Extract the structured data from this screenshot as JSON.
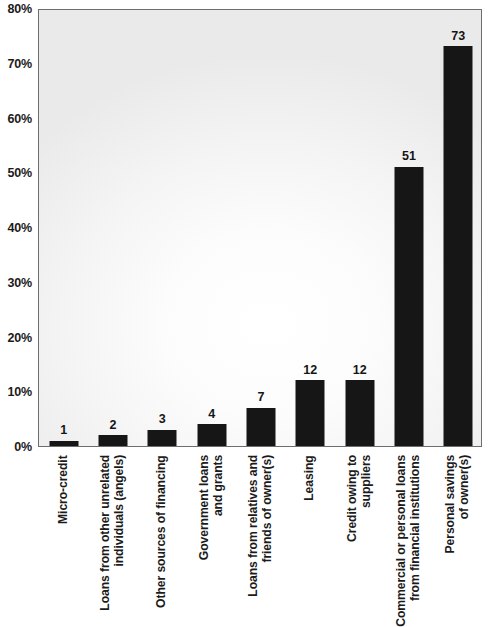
{
  "chart_data": {
    "type": "bar",
    "title": "",
    "subtitle": "",
    "xlabel": "",
    "ylabel": "",
    "ylim": [
      0,
      80
    ],
    "y_unit": "%",
    "grid": false,
    "legend": "none",
    "orientation": "vertical",
    "bar_color": "#161616",
    "y_ticks": [
      {
        "value": 0,
        "label": "0%"
      },
      {
        "value": 10,
        "label": "10%"
      },
      {
        "value": 20,
        "label": "20%"
      },
      {
        "value": 30,
        "label": "30%"
      },
      {
        "value": 40,
        "label": "40%"
      },
      {
        "value": 50,
        "label": "50%"
      },
      {
        "value": 60,
        "label": "60%"
      },
      {
        "value": 70,
        "label": "70%"
      },
      {
        "value": 80,
        "label": "80%"
      }
    ],
    "categories": [
      "Micro-credit",
      "Loans from other unrelated\nindividuals (angels)",
      "Other sources of financing",
      "Government loans\nand grants",
      "Loans from relatives and\nfriends of owner(s)",
      "Leasing",
      "Credit owing to\nsuppliers",
      "Commercial or personal loans\nfrom financial institutions",
      "Personal savings\nof owner(s)"
    ],
    "values": [
      1,
      2,
      3,
      4,
      7,
      12,
      12,
      51,
      73
    ],
    "data_labels": [
      "1",
      "2",
      "3",
      "4",
      "7",
      "12",
      "12",
      "51",
      "73"
    ]
  }
}
